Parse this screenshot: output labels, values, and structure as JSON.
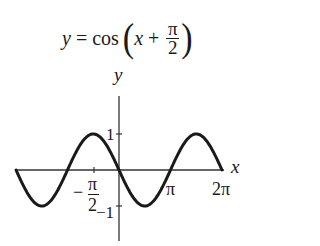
{
  "title": {
    "lhs": "y",
    "eq": " = cos",
    "open_paren": "(",
    "var": "x",
    "plus": " + ",
    "num": "π",
    "den": "2",
    "close_paren": ")"
  },
  "axes": {
    "x_label": "x",
    "y_label": "y"
  },
  "ticks": {
    "x": [
      {
        "label_num": "π",
        "label_den": "2",
        "sign": "−",
        "value": "-π/2"
      },
      {
        "label": "π",
        "value": "π"
      },
      {
        "label": "2π",
        "value": "2π"
      }
    ],
    "y": [
      {
        "label": "1",
        "value": 1
      },
      {
        "label": "−1",
        "value": -1
      }
    ]
  },
  "colors": {
    "curve": "#1a1a1a",
    "axis": "#333333",
    "background": "#ffffff"
  },
  "chart_data": {
    "type": "line",
    "xlabel": "x",
    "ylabel": "y",
    "function": "cos(x + pi/2)",
    "x_range": [
      -6.283,
      6.283
    ],
    "ylim": [
      -1.5,
      2.3
    ],
    "x_ticks": [
      "-π/2",
      "π",
      "2π"
    ],
    "y_ticks": [
      "1",
      "-1"
    ],
    "grid": false,
    "legend": null,
    "series": [
      {
        "name": "cos(x + π/2)",
        "x": [
          -6.283,
          -4.712,
          -3.142,
          -1.571,
          0,
          1.571,
          3.142,
          4.712,
          6.283
        ],
        "values": [
          0,
          -1,
          0,
          1,
          0,
          -1,
          0,
          1,
          0
        ]
      }
    ]
  }
}
